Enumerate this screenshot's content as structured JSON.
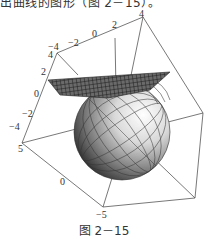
{
  "page": {
    "top_text": "出曲线的图形（图 2－15）。",
    "caption": "图 2－15"
  },
  "figure": {
    "tick_labels": {
      "top_edge": [
        "−4",
        "−2",
        "0",
        "2",
        "4"
      ],
      "left_edge": [
        "4",
        "2",
        "0",
        "−2",
        "−4"
      ],
      "bottom_edge": [
        "5",
        "0",
        "−5"
      ]
    },
    "colors": {
      "box_line": "#555555",
      "plane": "#333333",
      "sphere_light": "#f2f2f2",
      "sphere_dark": "#2a2a2a"
    }
  }
}
